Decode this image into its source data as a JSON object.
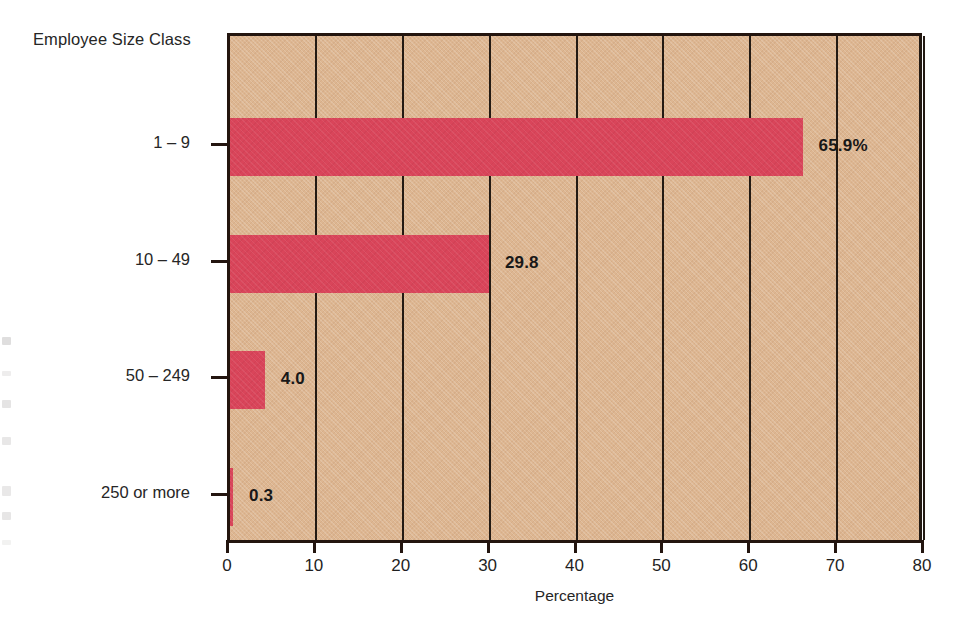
{
  "chart_data": {
    "type": "bar",
    "orientation": "horizontal",
    "title": "",
    "subtitle": "",
    "xlabel": "Percentage",
    "ylabel": "Employee Size Class",
    "categories": [
      "1 – 9",
      "10 – 49",
      "50 – 249",
      "250 or more"
    ],
    "values": [
      65.9,
      29.8,
      4.0,
      0.3
    ],
    "data_labels": [
      "65.9%",
      "29.8",
      "4.0",
      "0.3"
    ],
    "xlim": [
      0,
      80
    ],
    "xticks": [
      0,
      10,
      20,
      30,
      40,
      50,
      60,
      70,
      80
    ],
    "xtick_labels": [
      "0",
      "10",
      "20",
      "30",
      "40",
      "50",
      "60",
      "70",
      "80"
    ],
    "grid": "vertical",
    "legend": "none",
    "series": [
      {
        "name": "Percentage",
        "values": [
          65.9,
          29.8,
          4.0,
          0.3
        ]
      }
    ],
    "colors": {
      "bar": "#d9455a",
      "plot_background": "#ddb691",
      "axis": "#23150f",
      "text": "#262626",
      "page_background": "#ffffff"
    }
  },
  "axes": {
    "y_title": "Employee Size Class",
    "x_title": "Percentage"
  }
}
